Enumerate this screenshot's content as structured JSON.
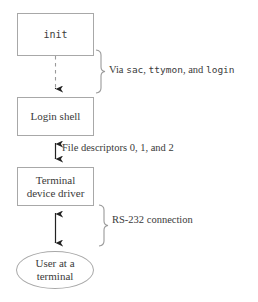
{
  "diagram": {
    "background_color": "#ffffff",
    "stroke_color": "#a8a8a8",
    "text_color": "#3a3a3a",
    "nodes": [
      {
        "id": "init",
        "label": "init",
        "shape": "rectangle",
        "font": "monospace"
      },
      {
        "id": "login_shell",
        "label": "Login shell",
        "shape": "rectangle",
        "font": "serif"
      },
      {
        "id": "terminal_driver",
        "label": "Terminal\ndevice driver",
        "shape": "rectangle",
        "font": "serif"
      },
      {
        "id": "user_terminal",
        "label": "User at a\nterminal",
        "shape": "ellipse",
        "font": "serif"
      }
    ],
    "edges": [
      {
        "id": "init_to_login",
        "from": "init",
        "to": "login_shell",
        "style": "dashed",
        "arrowheads": "down",
        "annotation_id": "via_sac"
      },
      {
        "id": "login_to_driver",
        "from": "login_shell",
        "to": "terminal_driver",
        "style": "solid",
        "arrowheads": "both",
        "annotation_id": "file_descriptors"
      },
      {
        "id": "driver_to_user",
        "from": "terminal_driver",
        "to": "user_terminal",
        "style": "solid",
        "arrowheads": "both",
        "annotation_id": "rs232"
      }
    ],
    "annotations": [
      {
        "id": "via_sac",
        "brace": true,
        "parts": [
          {
            "text": "Via ",
            "style": "serif"
          },
          {
            "text": "sac",
            "style": "code"
          },
          {
            "text": ", ",
            "style": "serif"
          },
          {
            "text": "ttymon",
            "style": "code"
          },
          {
            "text": ", and ",
            "style": "serif"
          },
          {
            "text": "login",
            "style": "code"
          }
        ],
        "plain_text": "Via sac, ttymon, and login"
      },
      {
        "id": "file_descriptors",
        "brace": false,
        "parts": [
          {
            "text": "File descriptors 0, 1, and 2",
            "style": "serif"
          }
        ],
        "plain_text": "File descriptors 0, 1, and 2"
      },
      {
        "id": "rs232",
        "brace": true,
        "parts": [
          {
            "text": "RS-232 connection",
            "style": "serif"
          }
        ],
        "plain_text": "RS-232 connection"
      }
    ]
  }
}
